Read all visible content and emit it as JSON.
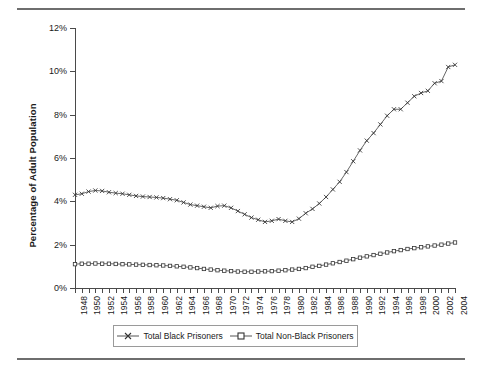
{
  "chart_data": {
    "type": "line",
    "title": "",
    "xlabel": "",
    "ylabel": "Percentage of Adult Population",
    "ylim": [
      0,
      12
    ],
    "yticks": [
      "0%",
      "2%",
      "4%",
      "6%",
      "8%",
      "10%",
      "12%"
    ],
    "ytick_values": [
      0,
      2,
      4,
      6,
      8,
      10,
      12
    ],
    "grid": false,
    "legend_position": "bottom",
    "x": [
      1948,
      1949,
      1950,
      1951,
      1952,
      1953,
      1954,
      1955,
      1956,
      1957,
      1958,
      1959,
      1960,
      1961,
      1962,
      1963,
      1964,
      1965,
      1966,
      1967,
      1968,
      1969,
      1970,
      1971,
      1972,
      1973,
      1974,
      1975,
      1976,
      1977,
      1978,
      1979,
      1980,
      1981,
      1982,
      1983,
      1984,
      1985,
      1986,
      1987,
      1988,
      1989,
      1990,
      1991,
      1992,
      1993,
      1994,
      1995,
      1996,
      1997,
      1998,
      1999,
      2000,
      2001,
      2002,
      2003,
      2004
    ],
    "xtick_labels": [
      "1948",
      "1950",
      "1952",
      "1954",
      "1956",
      "1958",
      "1960",
      "1962",
      "1964",
      "1966",
      "1968",
      "1970",
      "1972",
      "1974",
      "1976",
      "1978",
      "1980",
      "1982",
      "1984",
      "1986",
      "1988",
      "1990",
      "1992",
      "1994",
      "1996",
      "1998",
      "2000",
      "2002",
      "2004"
    ],
    "series": [
      {
        "name": "Total Black Prisoners",
        "marker": "x",
        "color": "#555555",
        "values": [
          4.3,
          4.35,
          4.45,
          4.5,
          4.48,
          4.42,
          4.38,
          4.35,
          4.3,
          4.25,
          4.22,
          4.2,
          4.18,
          4.15,
          4.1,
          4.05,
          3.95,
          3.85,
          3.8,
          3.75,
          3.7,
          3.78,
          3.8,
          3.7,
          3.55,
          3.4,
          3.25,
          3.15,
          3.05,
          3.1,
          3.18,
          3.1,
          3.05,
          3.2,
          3.45,
          3.65,
          3.9,
          4.2,
          4.55,
          4.9,
          5.35,
          5.85,
          6.35,
          6.8,
          7.15,
          7.55,
          7.95,
          8.25,
          8.25,
          8.55,
          8.85,
          9.0,
          9.1,
          9.45,
          9.55,
          10.2,
          10.3
        ]
      },
      {
        "name": "Total Non-Black Prisoners",
        "marker": "square",
        "color": "#555555",
        "values": [
          1.1,
          1.12,
          1.12,
          1.13,
          1.12,
          1.12,
          1.11,
          1.1,
          1.09,
          1.08,
          1.07,
          1.06,
          1.05,
          1.04,
          1.02,
          1.0,
          0.98,
          0.95,
          0.92,
          0.88,
          0.85,
          0.82,
          0.8,
          0.78,
          0.76,
          0.75,
          0.75,
          0.76,
          0.77,
          0.78,
          0.8,
          0.82,
          0.85,
          0.88,
          0.92,
          0.98,
          1.02,
          1.08,
          1.14,
          1.2,
          1.26,
          1.33,
          1.4,
          1.46,
          1.52,
          1.58,
          1.64,
          1.7,
          1.75,
          1.8,
          1.84,
          1.88,
          1.92,
          1.96,
          2.0,
          2.05,
          2.1
        ]
      }
    ]
  },
  "legend": {
    "items": [
      {
        "label": "Total Black Prisoners",
        "marker": "x"
      },
      {
        "label": "Total Non-Black Prisoners",
        "marker": "square"
      }
    ]
  }
}
